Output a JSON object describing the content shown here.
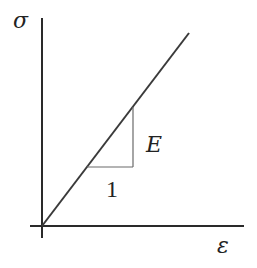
{
  "diagram": {
    "y_axis_label": "σ",
    "x_axis_label": "ε",
    "slope_rise_label": "E",
    "slope_run_label": "1",
    "colors": {
      "axis": "#2a2a2a",
      "line": "#3a3a3a",
      "triangle": "#6a6a6a",
      "text": "#222222",
      "background": "#ffffff"
    }
  }
}
